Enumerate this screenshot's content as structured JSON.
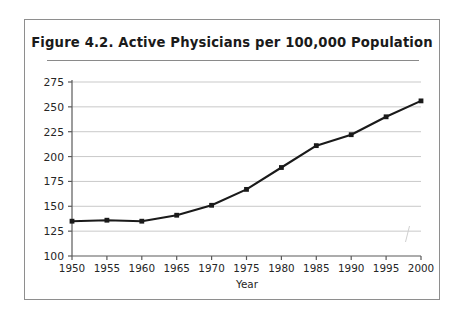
{
  "figure": {
    "title": "Figure 4.2.  Active Physicians per 100,000 Population"
  },
  "chart_data": {
    "type": "line",
    "title": "Figure 4.2.  Active Physicians per 100,000 Population",
    "xlabel": "Year",
    "ylabel": "",
    "x": [
      1950,
      1955,
      1960,
      1965,
      1970,
      1975,
      1980,
      1985,
      1990,
      1995,
      2000
    ],
    "values": [
      135,
      136,
      135,
      141,
      151,
      167,
      189,
      211,
      222,
      240,
      256
    ],
    "series": [
      {
        "name": "Active physicians per 100,000 population",
        "values": [
          135,
          136,
          135,
          141,
          151,
          167,
          189,
          211,
          222,
          240,
          256
        ]
      }
    ],
    "xtick_labels": [
      "1950",
      "1955",
      "1960",
      "1965",
      "1970",
      "1975",
      "1980",
      "1985",
      "1990",
      "1995",
      "2000"
    ],
    "ytick_labels": [
      "100",
      "125",
      "150",
      "175",
      "200",
      "225",
      "250",
      "275"
    ],
    "yticks": [
      100,
      125,
      150,
      175,
      200,
      225,
      250,
      275
    ],
    "ylim": [
      100,
      275
    ],
    "xlim": [
      1950,
      2000
    ],
    "grid": "horizontal",
    "legend": "none",
    "marker": "square",
    "line_color": "#1a1a1a",
    "grid_color": "#c9c9c9",
    "axis_color": "#5a5a5a"
  }
}
